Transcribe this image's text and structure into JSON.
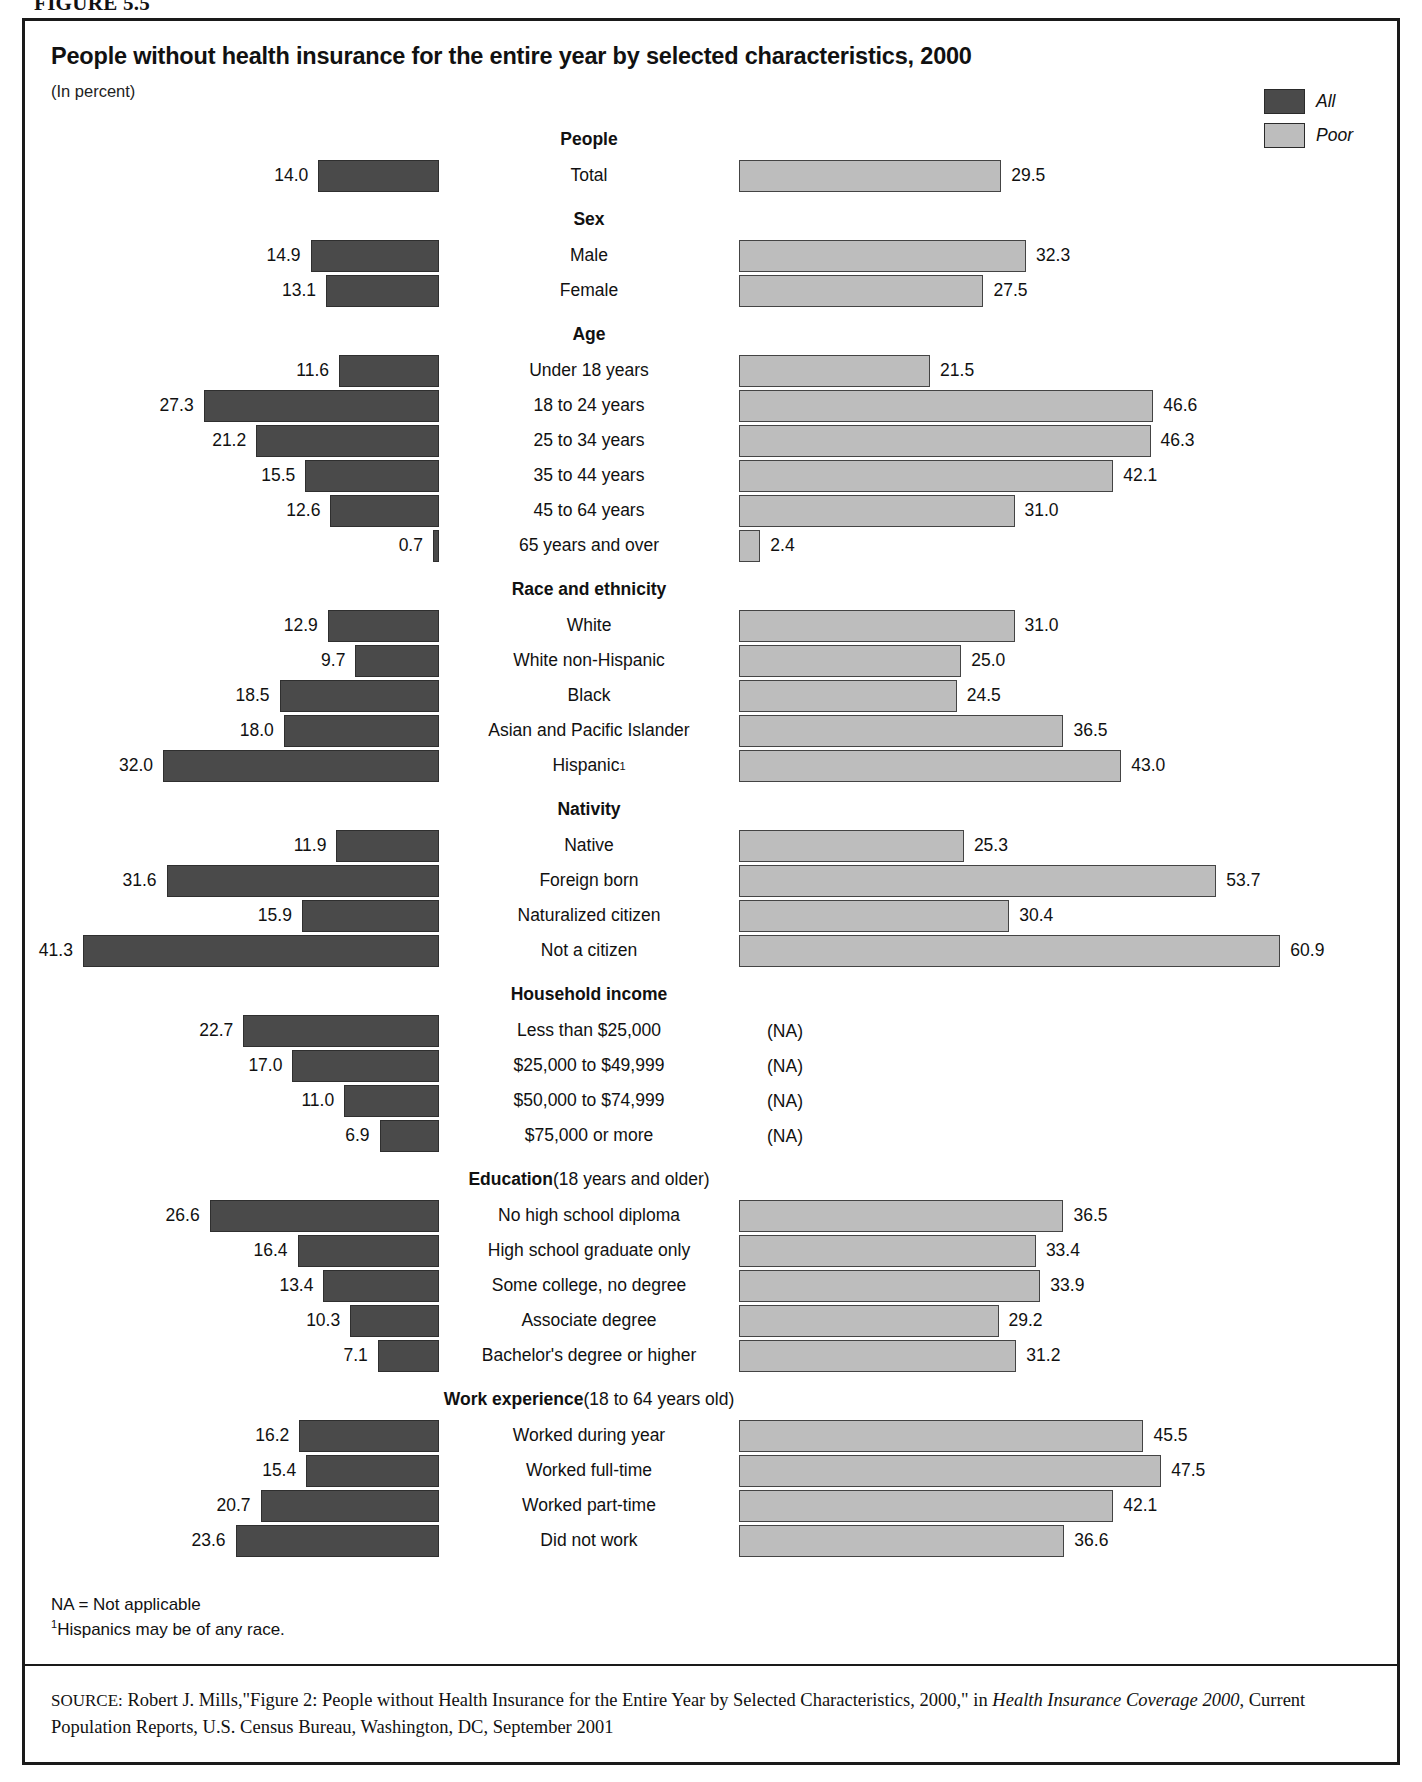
{
  "figure_label": "FIGURE 5.5",
  "title": "People without health insurance for the entire year by selected characteristics, 2000",
  "subtitle": "(In percent)",
  "legend": {
    "all_label": "All",
    "poor_label": "Poor",
    "all_color": "#4a4a4a",
    "poor_color": "#bdbdbd"
  },
  "notes": {
    "na_note": "NA = Not applicable",
    "footnote_marker": "1",
    "footnote_text": "Hispanics may be of any race."
  },
  "source": {
    "prefix": "SOURCE:",
    "text_1": " Robert J. Mills,\"Figure 2: People without Health Insurance for the Entire Year by Selected Characteristics, 2000,\" in ",
    "italic_1": "Health Insurance Coverage 2000",
    "text_2": ", Current Population Reports, U.S. Census Bureau, Washington, DC, September 2001"
  },
  "na_label": "(NA)",
  "chart_data": {
    "type": "bar",
    "orientation": "horizontal-diverging",
    "title": "People without health insurance for the entire year by selected characteristics, 2000",
    "subtitle": "(In percent)",
    "xlabel": "",
    "ylabel": "",
    "unit": "percent",
    "legend_position": "top-right",
    "grid": false,
    "left_axis_max": 45,
    "right_axis_max": 63,
    "series": [
      {
        "name": "All",
        "color": "#4a4a4a"
      },
      {
        "name": "Poor",
        "color": "#bdbdbd"
      }
    ],
    "rows": [
      {
        "kind": "group",
        "label": "People"
      },
      {
        "kind": "data",
        "label": "Total",
        "all": 14.0,
        "poor": 29.5
      },
      {
        "kind": "group",
        "label": "Sex"
      },
      {
        "kind": "data",
        "label": "Male",
        "all": 14.9,
        "poor": 32.3
      },
      {
        "kind": "data",
        "label": "Female",
        "all": 13.1,
        "poor": 27.5
      },
      {
        "kind": "group",
        "label": "Age"
      },
      {
        "kind": "data",
        "label": "Under 18 years",
        "all": 11.6,
        "poor": 21.5
      },
      {
        "kind": "data",
        "label": "18 to 24 years",
        "all": 27.3,
        "poor": 46.6
      },
      {
        "kind": "data",
        "label": "25 to 34 years",
        "all": 21.2,
        "poor": 46.3
      },
      {
        "kind": "data",
        "label": "35 to 44 years",
        "all": 15.5,
        "poor": 42.1
      },
      {
        "kind": "data",
        "label": "45 to 64 years",
        "all": 12.6,
        "poor": 31.0
      },
      {
        "kind": "data",
        "label": "65 years and over",
        "all": 0.7,
        "poor": 2.4
      },
      {
        "kind": "group",
        "label": "Race and ethnicity"
      },
      {
        "kind": "data",
        "label": "White",
        "all": 12.9,
        "poor": 31.0
      },
      {
        "kind": "data",
        "label": "White non-Hispanic",
        "all": 9.7,
        "poor": 25.0
      },
      {
        "kind": "data",
        "label": "Black",
        "all": 18.5,
        "poor": 24.5
      },
      {
        "kind": "data",
        "label": "Asian and Pacific Islander",
        "all": 18.0,
        "poor": 36.5
      },
      {
        "kind": "data",
        "label": "Hispanic",
        "footnote": "1",
        "all": 32.0,
        "poor": 43.0
      },
      {
        "kind": "group",
        "label": "Nativity"
      },
      {
        "kind": "data",
        "label": "Native",
        "all": 11.9,
        "poor": 25.3
      },
      {
        "kind": "data",
        "label": "Foreign born",
        "all": 31.6,
        "poor": 53.7
      },
      {
        "kind": "data",
        "label": "Naturalized citizen",
        "all": 15.9,
        "poor": 30.4
      },
      {
        "kind": "data",
        "label": "Not a citizen",
        "all": 41.3,
        "poor": 60.9
      },
      {
        "kind": "group",
        "label": "Household income"
      },
      {
        "kind": "data",
        "label": "Less than $25,000",
        "all": 22.7,
        "poor": null
      },
      {
        "kind": "data",
        "label": "$25,000 to $49,999",
        "all": 17.0,
        "poor": null
      },
      {
        "kind": "data",
        "label": "$50,000 to $74,999",
        "all": 11.0,
        "poor": null
      },
      {
        "kind": "data",
        "label": "$75,000 or more",
        "all": 6.9,
        "poor": null
      },
      {
        "kind": "group",
        "label": "Education",
        "label_normal": " (18 years and older)"
      },
      {
        "kind": "data",
        "label": "No high school diploma",
        "all": 26.6,
        "poor": 36.5
      },
      {
        "kind": "data",
        "label": "High school graduate only",
        "all": 16.4,
        "poor": 33.4
      },
      {
        "kind": "data",
        "label": "Some college, no degree",
        "all": 13.4,
        "poor": 33.9
      },
      {
        "kind": "data",
        "label": "Associate degree",
        "all": 10.3,
        "poor": 29.2
      },
      {
        "kind": "data",
        "label": "Bachelor's degree or higher",
        "all": 7.1,
        "poor": 31.2
      },
      {
        "kind": "group",
        "label": "Work experience",
        "label_normal": " (18 to 64 years old)"
      },
      {
        "kind": "data",
        "label": "Worked during year",
        "all": 16.2,
        "poor": 45.5
      },
      {
        "kind": "data",
        "label": "Worked full-time",
        "all": 15.4,
        "poor": 47.5
      },
      {
        "kind": "data",
        "label": "Worked part-time",
        "all": 20.7,
        "poor": 42.1
      },
      {
        "kind": "data",
        "label": "Did not work",
        "all": 23.6,
        "poor": 36.6
      }
    ]
  }
}
